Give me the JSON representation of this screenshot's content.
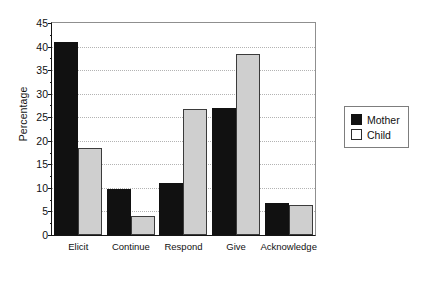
{
  "chart_data": {
    "type": "bar",
    "title": "",
    "subtitle": "",
    "xlabel": "",
    "ylabel": "Percentage",
    "categories": [
      "Elicit",
      "Continue",
      "Respond",
      "Give",
      "Acknowledge"
    ],
    "series": [
      {
        "name": "Mother",
        "color": "#111111",
        "values": [
          41,
          9.8,
          11,
          27,
          6.8
        ]
      },
      {
        "name": "Child",
        "color": "#cfcfcf",
        "values": [
          18.5,
          4,
          26.8,
          38.5,
          6.3
        ]
      }
    ],
    "ylim": [
      0,
      45
    ],
    "ytick_values": [
      0,
      5,
      10,
      15,
      20,
      25,
      30,
      35,
      40,
      45
    ],
    "ytick_labels": [
      "0",
      "5",
      "10",
      "15",
      "20",
      "25",
      "30",
      "35",
      "40",
      "45"
    ],
    "grid": true,
    "grid_axis": "y",
    "grid_style": "dotted",
    "legend": [
      "Mother",
      "Child"
    ],
    "legend_position": "right",
    "annotations": []
  },
  "legend": {
    "entries": [
      {
        "label": "Mother",
        "swatch": "mother-swatch"
      },
      {
        "label": "Child",
        "swatch": "child-swatch"
      }
    ]
  }
}
